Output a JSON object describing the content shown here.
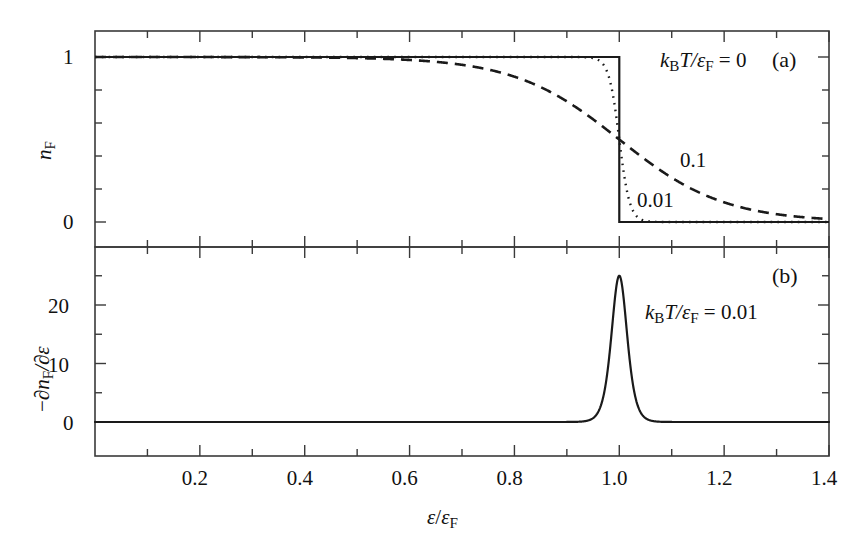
{
  "figure": {
    "background": "#ffffff",
    "line_color": "#1a1a1a",
    "axis_color": "#3a3a3a"
  },
  "panels": {
    "a": {
      "label": "(a)",
      "y_axis_label_main": "n",
      "y_axis_label_sub": "F",
      "y_ticks": [
        "1",
        "0"
      ],
      "legend_main": "T/",
      "legend_k": "k",
      "legend_k_sub": "B",
      "legend_eps": "ε",
      "legend_eps_sub": "F",
      "legend_eq": " = 0",
      "curve_label_dashed": "0.1",
      "curve_label_dotted": "0.01"
    },
    "b": {
      "label": "(b)",
      "y_axis_label": "−∂nᶠ/∂ε",
      "y_ticks": [
        "20",
        "10",
        "0"
      ],
      "legend_k": "k",
      "legend_k_sub": "B",
      "legend_main": "T/",
      "legend_eps": "ε",
      "legend_eps_sub": "F",
      "legend_eq": " = 0.01"
    }
  },
  "x_axis": {
    "label_eps": "ε",
    "label_slash": "/",
    "label_eps2": "ε",
    "label_sub": "F",
    "ticks": [
      "0.2",
      "0.4",
      "0.6",
      "0.8",
      "1.0",
      "1.2",
      "1.4"
    ],
    "tick_values": [
      0.2,
      0.4,
      0.6,
      0.8,
      1.0,
      1.2,
      1.4
    ]
  },
  "chart_data": {
    "type": "line",
    "title": "",
    "subplots": [
      {
        "id": "a",
        "label": "(a)",
        "xlabel": "eps/eps_F",
        "ylabel": "n_F",
        "xlim": [
          0.0,
          1.4
        ],
        "ylim": [
          -0.07,
          1.12
        ],
        "y_ticks_major": [
          0,
          1
        ],
        "y_ticks_minor": [
          0.2,
          0.4,
          0.6,
          0.8
        ],
        "grid": false,
        "series": [
          {
            "name": "kBT/epsF = 0",
            "style": "solid",
            "description": "Step function: n_F = 1 for eps < eps_F, 0 for eps > eps_F",
            "t": 0.0
          },
          {
            "name": "kBT/epsF = 0.01",
            "style": "dotted",
            "description": "Fermi-Dirac 1/(exp((x-1)/0.01)+1)",
            "t": 0.01
          },
          {
            "name": "kBT/epsF = 0.1",
            "style": "dashed",
            "description": "Fermi-Dirac 1/(exp((x-1)/0.1)+1)",
            "t": 0.1
          }
        ],
        "annotations": [
          {
            "text": "k_B T/eps_F = 0",
            "x": 1.02,
            "y": 0.97
          },
          {
            "text": "0.1",
            "x": 1.13,
            "y": 0.43
          },
          {
            "text": "0.01",
            "x": 1.04,
            "y": 0.18
          },
          {
            "text": "(a)",
            "x": 1.31,
            "y": 0.97
          }
        ]
      },
      {
        "id": "b",
        "label": "(b)",
        "xlabel": "eps/eps_F",
        "ylabel": "-d n_F / d eps",
        "xlim": [
          0.0,
          1.4
        ],
        "ylim": [
          -1.5,
          28
        ],
        "y_ticks_major": [
          0,
          10,
          20
        ],
        "y_ticks_minor": [
          5,
          15,
          25
        ],
        "grid": false,
        "series": [
          {
            "name": "kBT/epsF = 0.01",
            "style": "solid",
            "description": "Derivative of Fermi-Dirac: sech^2((x-1)/(2*0.01))/(4*0.01); peak 25 at x=1",
            "t": 0.01,
            "peak_x": 1.0,
            "peak_y": 25
          }
        ],
        "annotations": [
          {
            "text": "k_B T/eps_F = 0.01",
            "x": 1.05,
            "y": 17.5
          },
          {
            "text": "(b)",
            "x": 1.31,
            "y": 23.5
          }
        ]
      }
    ]
  }
}
